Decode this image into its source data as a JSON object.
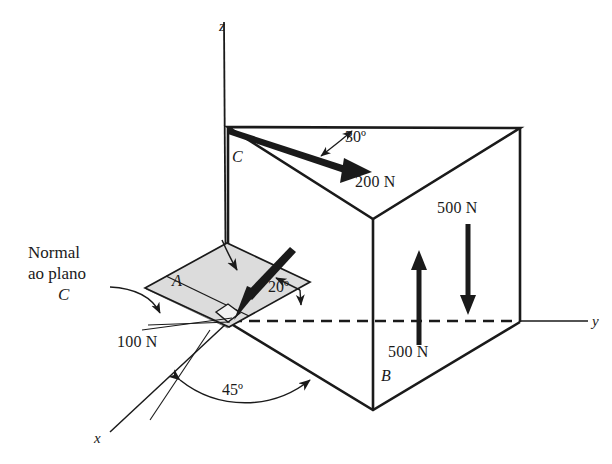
{
  "figure": {
    "background_color": "#ffffff",
    "ink_color": "#1a1a1a",
    "plane_fill_color": "#d8d8d8"
  },
  "axes": [
    {
      "name": "z-axis",
      "label": "z"
    },
    {
      "name": "y-axis",
      "label": "y"
    },
    {
      "name": "x-axis",
      "label": "x"
    }
  ],
  "face_labels": [
    {
      "name": "face-A",
      "label": "A"
    },
    {
      "name": "face-B",
      "label": "B"
    },
    {
      "name": "face-C",
      "label": "C"
    }
  ],
  "forces": [
    {
      "name": "force-200n",
      "label": "200 N",
      "magnitude": 200,
      "unit": "N",
      "face": "C"
    },
    {
      "name": "force-500n-down",
      "label": "500 N",
      "magnitude": 500,
      "unit": "N",
      "direction": "down"
    },
    {
      "name": "force-500n-up",
      "label": "500 N",
      "magnitude": 500,
      "unit": "N",
      "direction": "up"
    },
    {
      "name": "force-100n",
      "label": "100 N",
      "magnitude": 100,
      "unit": "N",
      "face": "A"
    }
  ],
  "angles": [
    {
      "name": "angle-30",
      "label": "30º",
      "value": 30
    },
    {
      "name": "angle-20",
      "label": "20º",
      "value": 20
    },
    {
      "name": "angle-45",
      "label": "45º",
      "value": 45
    }
  ],
  "annotations": {
    "normal_note_line1": "Normal",
    "normal_note_line2": "ao plano",
    "normal_note_line3": "C"
  }
}
